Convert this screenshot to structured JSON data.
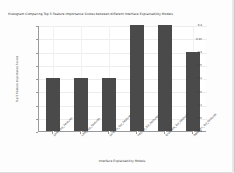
{
  "chart_data": {
    "type": "bar",
    "title": "Histogram Comparing Top 5 Feature Importance Scores between different Interface Explainability Models",
    "xlabel": "Interface Explainability Models",
    "ylabel": "Top 5 Feature Importance Scores",
    "categories": [
      "SHAP_Top_Features",
      "LIME_Top_Features",
      "Saliency_Top_Features",
      "IntGrad_Top_Features",
      "GradCAM_Top_Features",
      "DeepLIFT_Top_Features"
    ],
    "values": [
      0.2,
      0.2,
      0.2,
      0.4,
      0.4,
      0.3
    ],
    "ylim": [
      0.0,
      0.4
    ],
    "yticks": [
      0.0,
      0.05,
      0.1,
      0.15,
      0.2,
      0.25,
      0.3,
      0.35,
      0.4
    ],
    "ytick_labels": [
      "0.0",
      "0.05",
      "0.1",
      "0.15",
      "0.2",
      "0.25",
      "0.3",
      "0.35",
      "0.4"
    ],
    "grid": true,
    "legend": null,
    "bar_color": "#4a4a4a",
    "background_color": "#ffffff",
    "xtick_rotation": 45
  }
}
